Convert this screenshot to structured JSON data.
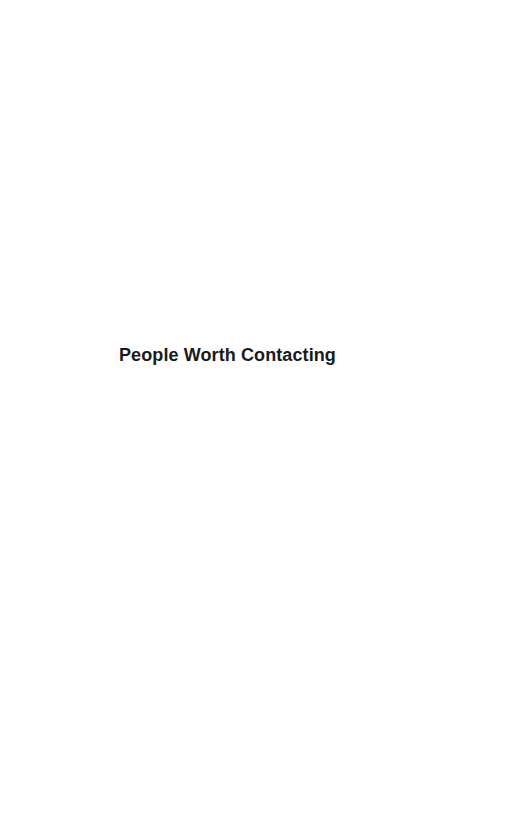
{
  "page": {
    "section_title": "People Worth Contacting"
  },
  "colors": {
    "background": "#ffffff",
    "text": "#1a1a1a"
  }
}
